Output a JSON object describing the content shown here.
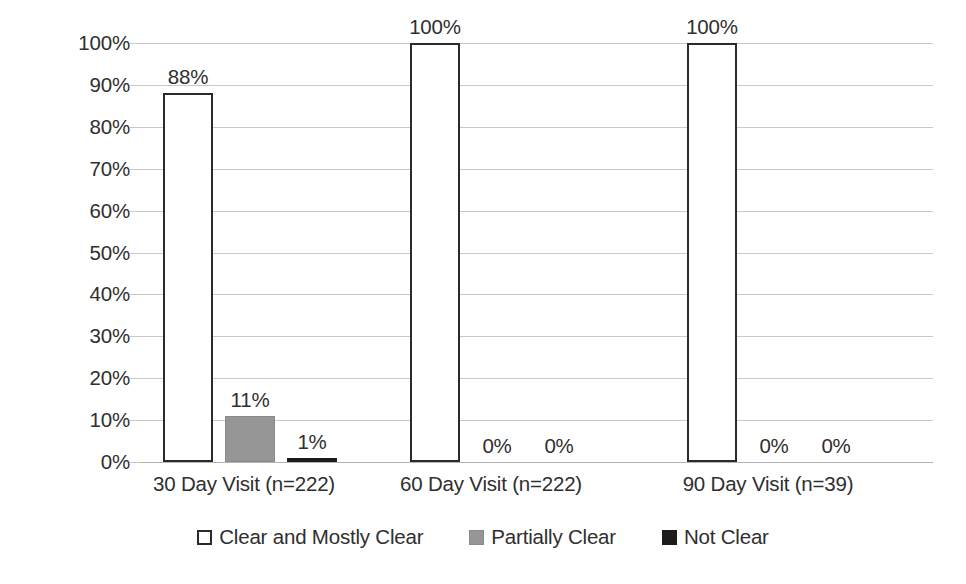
{
  "chart_data": {
    "type": "bar",
    "title": "",
    "xlabel": "",
    "ylabel": "",
    "ylim": [
      0,
      100
    ],
    "ytick_labels": [
      "0%",
      "10%",
      "20%",
      "30%",
      "40%",
      "50%",
      "60%",
      "70%",
      "80%",
      "90%",
      "100%"
    ],
    "ytick_values": [
      0,
      10,
      20,
      30,
      40,
      50,
      60,
      70,
      80,
      90,
      100
    ],
    "grid": true,
    "legend_position": "bottom-center",
    "categories": [
      "30 Day Visit (n=222)",
      "60 Day Visit (n=222)",
      "90 Day Visit (n=39)"
    ],
    "series": [
      {
        "name": "Clear and Mostly Clear",
        "color": "#ffffff",
        "border_color": "#2b2b2b",
        "values": [
          88,
          100,
          100
        ],
        "labels": [
          "88%",
          "100%",
          "100%"
        ]
      },
      {
        "name": "Partially Clear",
        "color": "#969696",
        "border_color": "#8a8a8a",
        "values": [
          11,
          0,
          0
        ],
        "labels": [
          "11%",
          "0%",
          "0%"
        ]
      },
      {
        "name": "Not Clear",
        "color": "#1c1c1c",
        "border_color": "#1c1c1c",
        "values": [
          1,
          0,
          0
        ],
        "labels": [
          "1%",
          "0%",
          "0%"
        ]
      }
    ]
  }
}
